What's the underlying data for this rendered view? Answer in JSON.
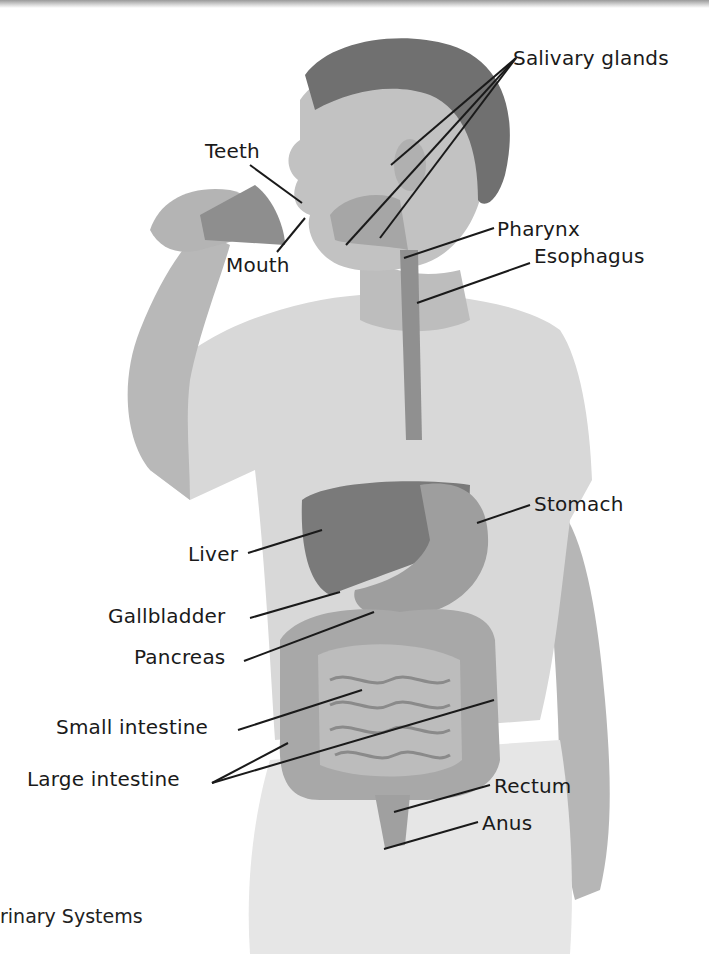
{
  "figure": {
    "background": "#ffffff",
    "colors": {
      "label_text": "#1a1a1a",
      "leader_line": "#1a1a1a",
      "shirt": "#dcdcdc",
      "skin": "#b8b8b8",
      "hair": "#6e6e6e",
      "organ_dark": "#7a7a7a",
      "organ_mid": "#9c9c9c",
      "organ_light": "#c2c2c2"
    }
  },
  "labels": {
    "salivary_glands": {
      "text": "Salivary glands",
      "x": 513,
      "y": 47
    },
    "teeth": {
      "text": "Teeth",
      "x": 205,
      "y": 140
    },
    "mouth": {
      "text": "Mouth",
      "x": 226,
      "y": 254
    },
    "pharynx": {
      "text": "Pharynx",
      "x": 497,
      "y": 218
    },
    "esophagus": {
      "text": "Esophagus",
      "x": 534,
      "y": 245
    },
    "stomach": {
      "text": "Stomach",
      "x": 534,
      "y": 493
    },
    "liver": {
      "text": "Liver",
      "x": 188,
      "y": 543
    },
    "gallbladder": {
      "text": "Gallbladder",
      "x": 108,
      "y": 605
    },
    "pancreas": {
      "text": "Pancreas",
      "x": 134,
      "y": 646
    },
    "small_intestine": {
      "text": "Small intestine",
      "x": 56,
      "y": 716
    },
    "large_intestine": {
      "text": "Large intestine",
      "x": 27,
      "y": 768
    },
    "rectum": {
      "text": "Rectum",
      "x": 494,
      "y": 775
    },
    "anus": {
      "text": "Anus",
      "x": 482,
      "y": 812
    }
  },
  "leaders": [
    {
      "for": "salivary_glands",
      "x1": 516,
      "y1": 58,
      "x2": 391,
      "y2": 165
    },
    {
      "for": "salivary_glands",
      "x1": 516,
      "y1": 58,
      "x2": 346,
      "y2": 245
    },
    {
      "for": "salivary_glands",
      "x1": 516,
      "y1": 58,
      "x2": 380,
      "y2": 238
    },
    {
      "for": "teeth",
      "x1": 250,
      "y1": 165,
      "x2": 302,
      "y2": 203
    },
    {
      "for": "mouth",
      "x1": 277,
      "y1": 252,
      "x2": 305,
      "y2": 218
    },
    {
      "for": "pharynx",
      "x1": 494,
      "y1": 228,
      "x2": 404,
      "y2": 258
    },
    {
      "for": "esophagus",
      "x1": 530,
      "y1": 263,
      "x2": 417,
      "y2": 303
    },
    {
      "for": "stomach",
      "x1": 530,
      "y1": 505,
      "x2": 477,
      "y2": 523
    },
    {
      "for": "liver",
      "x1": 248,
      "y1": 553,
      "x2": 322,
      "y2": 530
    },
    {
      "for": "gallbladder",
      "x1": 250,
      "y1": 618,
      "x2": 340,
      "y2": 592
    },
    {
      "for": "pancreas",
      "x1": 244,
      "y1": 661,
      "x2": 374,
      "y2": 612
    },
    {
      "for": "small_intestine",
      "x1": 238,
      "y1": 730,
      "x2": 362,
      "y2": 690
    },
    {
      "for": "large_intestine",
      "x1": 212,
      "y1": 783,
      "x2": 288,
      "y2": 743
    },
    {
      "for": "large_intestine",
      "x1": 212,
      "y1": 783,
      "x2": 494,
      "y2": 700
    },
    {
      "for": "rectum",
      "x1": 490,
      "y1": 785,
      "x2": 394,
      "y2": 812
    },
    {
      "for": "anus",
      "x1": 478,
      "y1": 822,
      "x2": 384,
      "y2": 849
    }
  ],
  "caption": {
    "text": "rinary Systems"
  }
}
